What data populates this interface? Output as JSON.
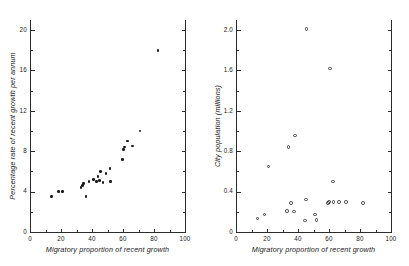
{
  "figure": {
    "background": "#ffffff",
    "marker_color": "#1a1a1a",
    "axis_color": "#2b2b2b"
  },
  "chart_data": [
    {
      "type": "scatter",
      "panel": "left",
      "title": "",
      "xlabel": "Migratory proportion of recent growth",
      "ylabel": "Percentage rate of recent growth per annum",
      "xlim": [
        0,
        100
      ],
      "ylim": [
        0,
        21
      ],
      "grid": false,
      "legend": "none",
      "marker": "filled-circle",
      "xticks": [
        0,
        20,
        40,
        60,
        80,
        100
      ],
      "xticklabels": [
        "0",
        "20",
        "40",
        "60",
        "80",
        "100"
      ],
      "xminorticks": [
        10,
        30,
        50,
        70,
        90
      ],
      "yticks": [
        0,
        4,
        8,
        12,
        16,
        20
      ],
      "yticklabels": [
        "0",
        "4",
        "8",
        "12",
        "16",
        "20"
      ],
      "yminorticks": [
        2,
        6,
        10,
        14,
        18
      ],
      "points": [
        {
          "x": 14.0,
          "y": 3.5
        },
        {
          "x": 18.5,
          "y": 4.0
        },
        {
          "x": 21.0,
          "y": 4.0
        },
        {
          "x": 33.0,
          "y": 4.4
        },
        {
          "x": 33.8,
          "y": 4.6
        },
        {
          "x": 34.5,
          "y": 4.8
        },
        {
          "x": 36.0,
          "y": 3.5
        },
        {
          "x": 38.0,
          "y": 5.0
        },
        {
          "x": 41.0,
          "y": 5.2
        },
        {
          "x": 43.0,
          "y": 5.0
        },
        {
          "x": 44.0,
          "y": 5.5
        },
        {
          "x": 44.8,
          "y": 5.1
        },
        {
          "x": 45.5,
          "y": 6.0
        },
        {
          "x": 47.0,
          "y": 4.9
        },
        {
          "x": 49.0,
          "y": 5.8
        },
        {
          "x": 51.5,
          "y": 6.3
        },
        {
          "x": 52.0,
          "y": 5.0
        },
        {
          "x": 59.5,
          "y": 7.2
        },
        {
          "x": 60.5,
          "y": 8.2
        },
        {
          "x": 60.8,
          "y": 8.4
        },
        {
          "x": 63.0,
          "y": 9.0
        },
        {
          "x": 66.0,
          "y": 8.5
        },
        {
          "x": 71.0,
          "y": 10.0
        },
        {
          "x": 82.5,
          "y": 18.0
        }
      ]
    },
    {
      "type": "scatter",
      "panel": "right",
      "title": "",
      "xlabel": "Migratory proportion of recent growth",
      "ylabel": "City population (millions)",
      "xlim": [
        0,
        100
      ],
      "ylim": [
        0,
        2.1
      ],
      "grid": false,
      "legend": "none",
      "marker": "open-circle",
      "xticks": [
        0,
        20,
        40,
        60,
        80,
        100
      ],
      "xticklabels": [
        "0",
        "20",
        "40",
        "60",
        "80",
        "100"
      ],
      "xminorticks": [
        10,
        30,
        50,
        70,
        90
      ],
      "yticks": [
        0,
        0.4,
        0.8,
        1.2,
        1.6,
        2.0
      ],
      "yticklabels": [
        "0",
        "0.4",
        "0.8",
        "1.2",
        "1.6",
        "2.0"
      ],
      "yminorticks": [
        0.2,
        0.6,
        1.0,
        1.4,
        1.8
      ],
      "points": [
        {
          "x": 14.0,
          "y": 0.135
        },
        {
          "x": 18.5,
          "y": 0.175
        },
        {
          "x": 21.0,
          "y": 0.65
        },
        {
          "x": 33.0,
          "y": 0.21
        },
        {
          "x": 34.0,
          "y": 0.84
        },
        {
          "x": 35.5,
          "y": 0.285
        },
        {
          "x": 37.5,
          "y": 0.205
        },
        {
          "x": 38.0,
          "y": 0.955
        },
        {
          "x": 44.5,
          "y": 0.115
        },
        {
          "x": 45.0,
          "y": 0.32
        },
        {
          "x": 45.5,
          "y": 2.01
        },
        {
          "x": 51.0,
          "y": 0.175
        },
        {
          "x": 52.0,
          "y": 0.12
        },
        {
          "x": 59.5,
          "y": 0.285
        },
        {
          "x": 60.0,
          "y": 0.3
        },
        {
          "x": 60.5,
          "y": 1.62
        },
        {
          "x": 62.5,
          "y": 0.5
        },
        {
          "x": 63.0,
          "y": 0.3
        },
        {
          "x": 66.5,
          "y": 0.295
        },
        {
          "x": 71.0,
          "y": 0.295
        },
        {
          "x": 82.0,
          "y": 0.285
        }
      ]
    }
  ]
}
